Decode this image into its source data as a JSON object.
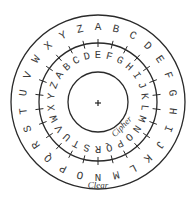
{
  "diagram": {
    "outer_ring": {
      "label": "Clear",
      "letters": [
        "A",
        "B",
        "C",
        "D",
        "E",
        "F",
        "G",
        "H",
        "I",
        "J",
        "K",
        "L",
        "M",
        "N",
        "O",
        "P",
        "Q",
        "R",
        "S",
        "T",
        "U",
        "V",
        "W",
        "X",
        "Y",
        "Z"
      ],
      "start_letter_at_top": "A",
      "direction": "clockwise"
    },
    "inner_ring": {
      "label": "Cipher",
      "letters": [
        "A",
        "B",
        "C",
        "D",
        "E",
        "F",
        "G",
        "H",
        "I",
        "J",
        "K",
        "L",
        "M",
        "N",
        "O",
        "P",
        "Q",
        "R",
        "S",
        "T",
        "U",
        "V",
        "W",
        "X",
        "Y",
        "Z"
      ],
      "start_letter_at_top": "E",
      "direction": "clockwise",
      "shift": 4
    },
    "tick_count": 26,
    "center_mark": "+"
  },
  "style": {
    "stroke_color": "#2a2a2a",
    "text_color": "#3a3a3a",
    "background": "#ffffff"
  },
  "geometry": {
    "cx": 98,
    "cy": 102,
    "outer_r": 87,
    "middle_r": 59,
    "inner_r": 30,
    "outer_letter_r": 75,
    "inner_letter_r": 47,
    "tick_len": 4
  }
}
